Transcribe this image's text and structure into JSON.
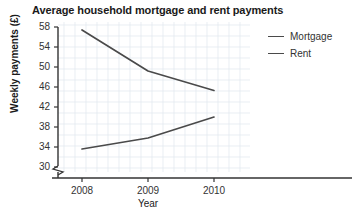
{
  "chart_data": {
    "type": "line",
    "title": "Average household mortgage and rent payments",
    "xlabel": "Year",
    "ylabel": "Weekly payments (£)",
    "categories": [
      "2008",
      "2009",
      "2010"
    ],
    "x": [
      2008,
      2009,
      2010
    ],
    "xlim": [
      2007.6,
      2010.4
    ],
    "ylim": [
      30,
      58
    ],
    "y_ticks": [
      30,
      34,
      38,
      42,
      46,
      50,
      54,
      58
    ],
    "y_tick_labels": [
      "30",
      "34",
      "38",
      "42",
      "46",
      "50",
      "54",
      "58"
    ],
    "x_tick_labels": [
      "2008",
      "2009",
      "2010"
    ],
    "axis_break": true,
    "grid": true,
    "grid_color": "#dfe6ee",
    "legend_position": "right",
    "line_color": "#4a4a4a",
    "series": [
      {
        "name": "Mortgage",
        "values": [
          57.4,
          49.2,
          45.3
        ]
      },
      {
        "name": "Rent",
        "values": [
          33.6,
          35.8,
          40.0
        ]
      }
    ]
  },
  "legend": {
    "items": [
      {
        "label": "Mortgage"
      },
      {
        "label": "Rent"
      }
    ]
  }
}
